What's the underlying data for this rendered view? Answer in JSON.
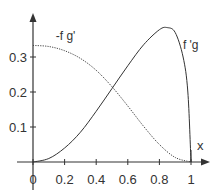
{
  "chart_data": {
    "type": "line",
    "title": "",
    "xlabel": "x",
    "ylabel": "",
    "xlim": [
      0,
      1
    ],
    "ylim": [
      0,
      0.4
    ],
    "grid": false,
    "legend": "inline labels",
    "x_ticks": [
      "0",
      "0.2",
      "0.4",
      "0.6",
      "0.8",
      "1"
    ],
    "y_ticks": [
      "0.1",
      "0.2",
      "0.3"
    ],
    "series": [
      {
        "name": "-f g'",
        "style": "dotted",
        "x": [
          0,
          0.1,
          0.2,
          0.3,
          0.4,
          0.5,
          0.6,
          0.7,
          0.8,
          0.9,
          1.0
        ],
        "y": [
          0.333,
          0.33,
          0.318,
          0.296,
          0.262,
          0.215,
          0.16,
          0.102,
          0.05,
          0.013,
          0
        ]
      },
      {
        "name": "f 'g",
        "style": "solid",
        "x": [
          0,
          0.1,
          0.2,
          0.3,
          0.4,
          0.5,
          0.6,
          0.7,
          0.8,
          0.85,
          0.9,
          0.95,
          0.98,
          1.0
        ],
        "y": [
          0,
          0.01,
          0.04,
          0.085,
          0.145,
          0.21,
          0.275,
          0.335,
          0.378,
          0.384,
          0.37,
          0.3,
          0.2,
          0
        ]
      }
    ],
    "annotations": [
      {
        "text": "-f g'",
        "x": 0.22,
        "y": 0.36
      },
      {
        "text": "f 'g",
        "x": 0.74,
        "y": 0.335
      }
    ]
  }
}
